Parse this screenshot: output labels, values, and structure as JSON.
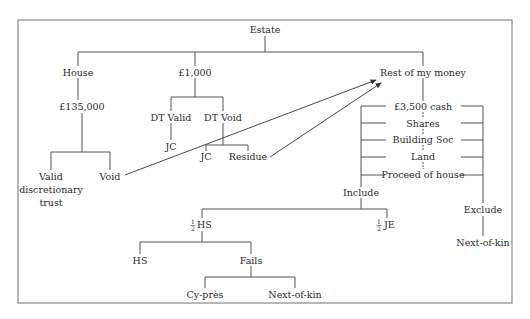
{
  "nodes": {
    "estate": "Estate",
    "house": "House",
    "house_value": "£135,000",
    "valid_dt_line1": "Valid",
    "valid_dt_line2": "discretionary",
    "valid_dt_line3": "trust",
    "void": "Void",
    "thousand": "£1,000",
    "dt_valid": "DT Valid",
    "dt_void": "DT Void",
    "jc_valid": "JC",
    "jc_void": "JC",
    "residue": "Residue",
    "rest_of_money": "Rest of my money",
    "cash": "£3,500 cash",
    "shares": "Shares",
    "building_soc": "Building Soc",
    "land": "Land",
    "proceed_house": "Proceed of house",
    "include": "Include",
    "exclude": "Exclude",
    "next_of_kin_right": "Next-of-kin",
    "half": "1",
    "half_den": "2",
    "half_hs": "HS",
    "half_je": "JE",
    "hs": "HS",
    "fails": "Fails",
    "cy_pres": "Cy-près",
    "next_of_kin_bottom": "Next-of-kin"
  }
}
